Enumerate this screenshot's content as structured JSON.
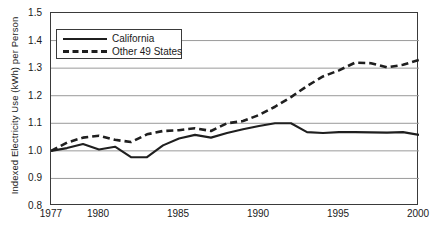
{
  "chart_data": {
    "type": "line",
    "title": "",
    "xlabel": "",
    "ylabel": "Indexed Electricity Use (kWh) per Person",
    "xlim": [
      1977,
      2000
    ],
    "ylim": [
      0.8,
      1.5
    ],
    "ytick_values": [
      0.8,
      0.9,
      1.0,
      1.1,
      1.2,
      1.3,
      1.4,
      1.5
    ],
    "ytick_labels": [
      "0.8",
      "0.9",
      "1.0",
      "1.1",
      "1.2",
      "1.3",
      "1.4",
      "1.5"
    ],
    "xtick_values": [
      1977,
      1980,
      1985,
      1990,
      1995,
      2000
    ],
    "xtick_labels": [
      "1977",
      "1980",
      "1985",
      "1990",
      "1995",
      "2000"
    ],
    "grid": "horizontal",
    "legend_position": "top-left-inside",
    "x": [
      1977,
      1978,
      1979,
      1980,
      1981,
      1982,
      1983,
      1984,
      1985,
      1986,
      1987,
      1988,
      1989,
      1990,
      1991,
      1992,
      1993,
      1994,
      1995,
      1996,
      1997,
      1998,
      1999,
      2000
    ],
    "series": [
      {
        "name": "California",
        "style": "solid",
        "color": "#1f1f1f",
        "values": [
          1.0,
          1.01,
          1.025,
          1.005,
          1.015,
          0.977,
          0.977,
          1.02,
          1.045,
          1.058,
          1.048,
          1.065,
          1.078,
          1.09,
          1.1,
          1.1,
          1.068,
          1.065,
          1.068,
          1.068,
          1.067,
          1.066,
          1.068,
          1.058
        ]
      },
      {
        "name": "Other 49 States",
        "style": "dashed",
        "color": "#1f1f1f",
        "values": [
          1.0,
          1.03,
          1.048,
          1.055,
          1.04,
          1.032,
          1.06,
          1.072,
          1.075,
          1.082,
          1.072,
          1.1,
          1.108,
          1.13,
          1.16,
          1.195,
          1.235,
          1.27,
          1.292,
          1.32,
          1.318,
          1.303,
          1.312,
          1.33
        ]
      }
    ],
    "series_extended": {
      "note": "x-range continues to 2000; full value list matches x array length"
    }
  },
  "legend": {
    "entries": [
      {
        "label": "California",
        "key": "solid-line-key"
      },
      {
        "label": "Other 49 States",
        "key": "dashed-line-key"
      }
    ]
  },
  "axes": {
    "y_axis_title": "Indexed Electricity Use (kWh) per Person"
  }
}
